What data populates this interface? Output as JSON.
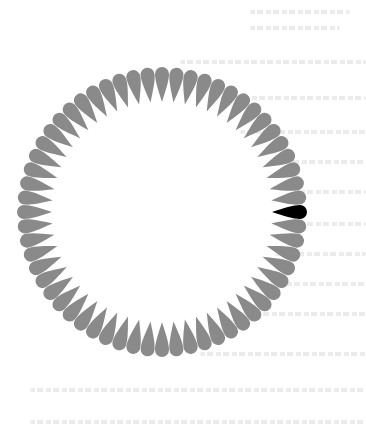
{
  "figure": {
    "ring": {
      "center_x": 162,
      "center_y": 212,
      "inner_radius": 110,
      "outer_radius": 145,
      "petal_count": 60,
      "petal_width": 14,
      "petal_orientation": "radial, rounded end outward"
    },
    "colors": {
      "background": "#ffffff",
      "distractor_petal": "#8a8a8a",
      "target_petal": "#000000",
      "ghost_text": "#d0d0d0"
    },
    "target": {
      "index": 0,
      "angle_deg": 0,
      "position": "right (3 o'clock)"
    }
  },
  "ghost_text_lines": [
    {
      "x": 250,
      "y": 10,
      "w": 100
    },
    {
      "x": 250,
      "y": 26,
      "w": 90
    },
    {
      "x": 180,
      "y": 60,
      "w": 186
    },
    {
      "x": 220,
      "y": 96,
      "w": 146
    },
    {
      "x": 240,
      "y": 130,
      "w": 126
    },
    {
      "x": 270,
      "y": 160,
      "w": 96
    },
    {
      "x": 300,
      "y": 190,
      "w": 66
    },
    {
      "x": 300,
      "y": 222,
      "w": 66
    },
    {
      "x": 275,
      "y": 252,
      "w": 91
    },
    {
      "x": 255,
      "y": 282,
      "w": 111
    },
    {
      "x": 240,
      "y": 312,
      "w": 126
    },
    {
      "x": 200,
      "y": 352,
      "w": 166
    },
    {
      "x": 30,
      "y": 388,
      "w": 336
    },
    {
      "x": 30,
      "y": 420,
      "w": 336
    }
  ]
}
